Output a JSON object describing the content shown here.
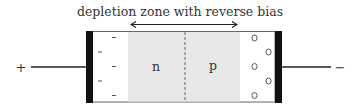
{
  "diagram": {
    "title": "depletion zone with reverse bias",
    "terminals": {
      "left": "+",
      "right": "−"
    },
    "regions": {
      "n_label": "n",
      "p_label": "p"
    },
    "carriers": {
      "electron_symbol": "-",
      "hole_symbol": "o",
      "electrons_count": 5,
      "holes_count": 5
    },
    "colors": {
      "depletion_fill": "#e8e8e8",
      "electrode": "#111111",
      "wire": "#222222",
      "border": "#555555",
      "text": "#333333"
    }
  }
}
